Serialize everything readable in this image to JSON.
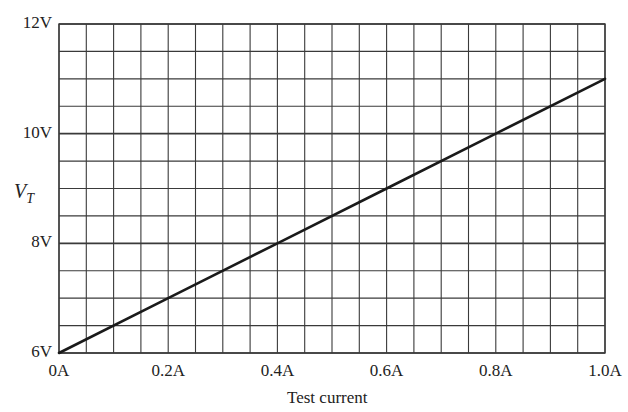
{
  "chart_data": {
    "type": "line",
    "title": "",
    "xlabel": "Test current",
    "ylabel": "V_T",
    "ylabel_main": "V",
    "ylabel_sub": "T",
    "xlim": [
      0,
      1.0
    ],
    "ylim": [
      6,
      12
    ],
    "x_ticks": [
      0,
      0.2,
      0.4,
      0.6,
      0.8,
      1.0
    ],
    "x_tick_labels": [
      "0A",
      "0.2A",
      "0.4A",
      "0.6A",
      "0.8A",
      "1.0A"
    ],
    "y_ticks": [
      6,
      8,
      10,
      12
    ],
    "y_tick_labels": [
      "6V",
      "8V",
      "10V",
      "12V"
    ],
    "grid": true,
    "grid_x_step": 0.05,
    "grid_y_step": 0.5,
    "legend": null,
    "series": [
      {
        "name": "V_T",
        "x": [
          0,
          0.2,
          0.4,
          0.6,
          0.8,
          1.0
        ],
        "values": [
          6,
          7,
          8,
          9,
          10,
          11
        ]
      }
    ]
  },
  "colors": {
    "grid": "#3a3a3a",
    "line": "#1a1a1a",
    "text": "#222222",
    "background": "#ffffff"
  }
}
